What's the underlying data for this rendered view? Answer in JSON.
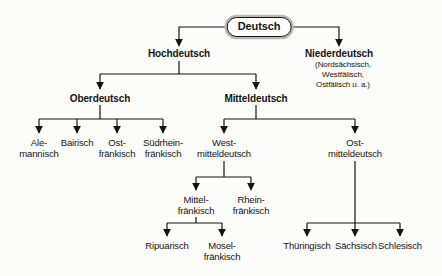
{
  "nodes": {
    "deutsch": {
      "label": "Deutsch"
    },
    "hochdeutsch": {
      "label": "Hochdeutsch"
    },
    "niederdeutsch": {
      "label": "Niederdeutsch",
      "note": "(Nordsächsisch, Westfälisch,\nOstfälisch u. a.)"
    },
    "oberdeutsch": {
      "label": "Oberdeutsch"
    },
    "mitteldeutsch": {
      "label": "Mitteldeutsch"
    },
    "alemannisch": {
      "label": "Ale-\nmannisch"
    },
    "bairisch": {
      "label": "Bairisch"
    },
    "ostfraenkisch": {
      "label": "Ost-\nfränkisch"
    },
    "suedrheinfraenkisch": {
      "label": "Südrhein-\nfränkisch"
    },
    "westmitteldeutsch": {
      "label": "West-\nmitteldeutsch"
    },
    "ostmitteldeutsch": {
      "label": "Ost-\nmitteldeutsch"
    },
    "mittelfraenkisch": {
      "label": "Mittel-\nfränkisch"
    },
    "rheinfraenkisch": {
      "label": "Rhein-\nfränkisch"
    },
    "ripuarisch": {
      "label": "Ripuarisch"
    },
    "moselfraenkisch": {
      "label": "Mosel-\nfränkisch"
    },
    "thueringisch": {
      "label": "Thüringisch"
    },
    "saechsisch": {
      "label": "Sächsisch"
    },
    "schlesisch": {
      "label": "Schlesisch"
    }
  },
  "hierarchy": {
    "deutsch": [
      "hochdeutsch",
      "niederdeutsch"
    ],
    "hochdeutsch": [
      "oberdeutsch",
      "mitteldeutsch"
    ],
    "oberdeutsch": [
      "alemannisch",
      "bairisch",
      "ostfraenkisch",
      "suedrheinfraenkisch"
    ],
    "mitteldeutsch": [
      "westmitteldeutsch",
      "ostmitteldeutsch"
    ],
    "westmitteldeutsch": [
      "mittelfraenkisch",
      "rheinfraenkisch"
    ],
    "mittelfraenkisch": [
      "ripuarisch",
      "moselfraenkisch"
    ],
    "ostmitteldeutsch": [
      "thueringisch",
      "saechsisch",
      "schlesisch"
    ]
  },
  "colors": {
    "line": "#141414",
    "text": "#141414",
    "background": "#fcfcfa",
    "root_border": "#141414",
    "root_outer_ring": "#b9b9b7"
  }
}
